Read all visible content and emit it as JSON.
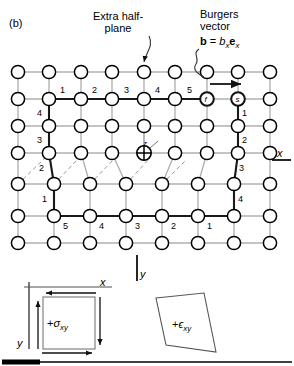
{
  "figure": {
    "panel_label": "(b)",
    "annotations": {
      "extra_halfplane": "Extra half-\nplane",
      "burgers_title": "Burgers\nvector",
      "burgers_equation_html": "<b>b</b> = <i>b</i><sub><i>x</i></sub><b>e</b><sub><i>x</i></sub>",
      "dislocation_axis": "z"
    },
    "axes": {
      "x_right": "x",
      "y_bottom": "y"
    },
    "circuit": {
      "start_node": "s",
      "finish_node": "f",
      "top_steps": [
        "1",
        "2",
        "3",
        "4",
        "5"
      ],
      "right_steps": [
        "1",
        "2",
        "3",
        "4"
      ],
      "bottom_steps": [
        "5",
        "4",
        "3",
        "2",
        "1"
      ],
      "left_steps": [
        "4",
        "3",
        "2",
        "1"
      ]
    },
    "insets": {
      "stress_label_html": "+<i>σ</i><sub><i>xy</i></sub>",
      "strain_label_html": "+<i>ϵ</i><sub><i>xy</i></sub>",
      "inset_x_axis": "x",
      "inset_y_axis": "y"
    },
    "colors": {
      "lattice_bond": "#b0b0b0",
      "circuit_bond": "#1a1a1a",
      "node_edge": "#000000",
      "node_fill": "#ffffff",
      "slip_dash": "#9a9a9a",
      "rule": "#000000"
    }
  }
}
